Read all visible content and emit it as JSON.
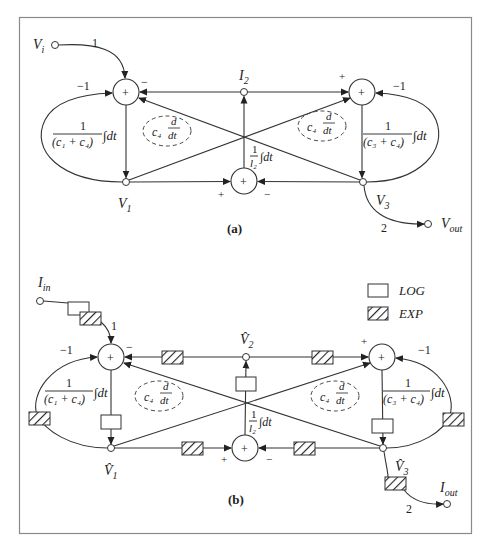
{
  "figure": {
    "border_color": "#8a8a8a",
    "line_color": "#333333"
  },
  "diagram_a": {
    "label": "(a)",
    "input_label": "V",
    "input_sub": "i",
    "output_label": "V",
    "output_sub": "out",
    "input_gain": "1",
    "output_gain": "2",
    "left_feedback_gain": "−1",
    "right_feedback_gain": "−1",
    "node_top": {
      "label": "I",
      "sub": "2"
    },
    "node_left": {
      "label": "V",
      "sub": "1"
    },
    "node_right": {
      "label": "V",
      "sub": "3"
    },
    "left_integrator": {
      "num": "1",
      "den": "(c₁ + c₄)",
      "op": "∫dt"
    },
    "right_integrator": {
      "num": "1",
      "den": "(c₃ + c₄)",
      "op": "∫dt"
    },
    "center_integrator": {
      "num": "1",
      "den": "l₂",
      "op": "∫dt"
    },
    "left_differentiator": {
      "coef": "c₄",
      "num": "d",
      "den": "dt"
    },
    "right_differentiator": {
      "coef": "c₄",
      "num": "d",
      "den": "dt"
    },
    "summer_symbol": "+",
    "signs": {
      "left_top": "−",
      "right_top": "+",
      "bottom_left": "+",
      "bottom_right": "−"
    }
  },
  "diagram_b": {
    "label": "(b)",
    "input_label": "I",
    "input_sub": "in",
    "output_label": "I",
    "output_sub": "out",
    "input_gain": "1",
    "output_gain": "2",
    "left_feedback_gain": "−1",
    "right_feedback_gain": "−1",
    "node_top": {
      "label": "V̂",
      "sub": "2"
    },
    "node_left": {
      "label": "V̂",
      "sub": "1"
    },
    "node_right": {
      "label": "V̂",
      "sub": "3"
    },
    "left_integrator": {
      "num": "1",
      "den": "(c₁ + c₄)",
      "op": "∫dt"
    },
    "right_integrator": {
      "num": "1",
      "den": "(c₃ + c₄)",
      "op": "∫dt"
    },
    "center_integrator": {
      "num": "1",
      "den": "l₂",
      "op": "∫dt"
    },
    "left_differentiator": {
      "coef": "c₄",
      "num": "d",
      "den": "dt"
    },
    "right_differentiator": {
      "coef": "c₄",
      "num": "d",
      "den": "dt"
    },
    "summer_symbol": "+",
    "signs": {
      "left_top": "−",
      "right_top": "+",
      "bottom_left": "+",
      "bottom_right": "−"
    },
    "legend": [
      {
        "icon": "log-block-icon",
        "label": "LOG"
      },
      {
        "icon": "exp-block-icon",
        "label": "EXP"
      }
    ]
  }
}
